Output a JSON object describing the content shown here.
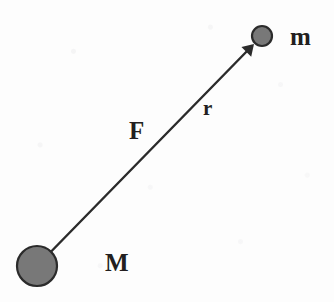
{
  "figure": {
    "background_color": "#fdfdfd",
    "body_fill_color": "#787878",
    "body_stroke_color": "#2b2b2b",
    "line_color": "#2b2b2b",
    "label_color": "#231f20",
    "canvas": {
      "width": 334,
      "height": 302
    }
  },
  "bodies": [
    {
      "id": "large-mass",
      "label": "M",
      "label_x": 105,
      "label_y": 250,
      "label_size": "big",
      "center_x": 37,
      "center_y": 266,
      "radius": 20
    },
    {
      "id": "small-mass",
      "label": "m",
      "label_x": 290,
      "label_y": 24,
      "label_size": "big",
      "center_x": 262,
      "center_y": 36,
      "radius": 10
    }
  ],
  "vector": {
    "id": "force-separation-line",
    "start_x": 37,
    "start_y": 266,
    "end_x": 252,
    "end_y": 46,
    "stroke_width": 2.4,
    "arrowhead": {
      "tip_x": 254,
      "tip_y": 44,
      "size": 11
    }
  },
  "annotations": [
    {
      "id": "force-label",
      "text": "F",
      "x": 129,
      "y": 118,
      "size": "big"
    },
    {
      "id": "distance-label",
      "text": "r",
      "x": 203,
      "y": 98,
      "size": "small"
    }
  ]
}
